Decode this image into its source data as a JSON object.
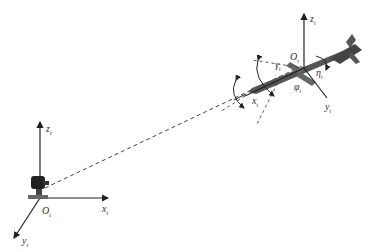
{
  "diagram": {
    "type": "coordinate-frame geometry diagram",
    "ground_frame": {
      "origin_label": "O",
      "origin_sub": "r",
      "axes": [
        {
          "label": "x",
          "sub": "r"
        },
        {
          "label": "y",
          "sub": "r"
        },
        {
          "label": "z",
          "sub": "r"
        }
      ],
      "object": "tracking camera / sensor on tripod base"
    },
    "target_frame": {
      "origin_label": "O",
      "origin_sub": "t",
      "axes": [
        {
          "label": "x",
          "sub": "t"
        },
        {
          "label": "y",
          "sub": "t"
        },
        {
          "label": "z",
          "sub": "t"
        }
      ],
      "object": "missile",
      "angles": [
        {
          "label": "γ",
          "sub": "t"
        },
        {
          "label": "η",
          "sub": "t"
        },
        {
          "label": "φ",
          "sub": "t"
        }
      ]
    },
    "line_of_sight": "dashed line from ground origin to target"
  },
  "colors": {
    "lines": "#222222",
    "missile": "#555555",
    "dashed": "#444444"
  }
}
